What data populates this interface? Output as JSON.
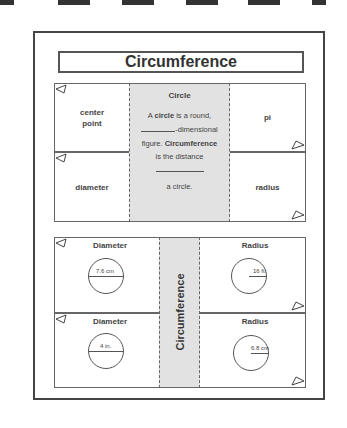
{
  "page": {
    "title": "Circumference"
  },
  "upper_foldable": {
    "left_flaps": [
      "center\npoint",
      "diameter"
    ],
    "right_flaps": [
      "pi",
      "radius"
    ],
    "center": {
      "heading": "Circle",
      "line1_pre": "A ",
      "line1_bold": "circle",
      "line1_post": " is a round,",
      "line2": "-dimensional",
      "line3_pre": "figure. ",
      "line3_bold": "Circumference",
      "line4": "is the distance",
      "line6": "a circle."
    }
  },
  "lower_foldable": {
    "center_label": "Circumference",
    "flaps": [
      {
        "heading": "Diameter",
        "measure": "7.6 cm",
        "type": "diameter"
      },
      {
        "heading": "Radius",
        "measure": "16 ft.",
        "type": "radius"
      },
      {
        "heading": "Diameter",
        "measure": "4 in.",
        "type": "diameter"
      },
      {
        "heading": "Radius",
        "measure": "6.8 cm",
        "type": "radius"
      }
    ]
  },
  "colors": {
    "center_fill": "#e2e2e2",
    "line": "#555555"
  }
}
